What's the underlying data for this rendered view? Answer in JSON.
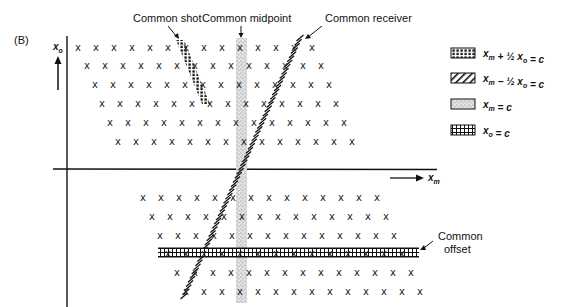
{
  "panel_label": "(B)",
  "labels": {
    "common_shot": "Common shot",
    "common_midpoint": "Common midpoint",
    "common_receiver": "Common receiver",
    "common_offset_line1": "Common",
    "common_offset_line2": "offset"
  },
  "axes": {
    "x_label_main": "x",
    "x_label_sub": "m",
    "y_label_main": "x",
    "y_label_sub": "o"
  },
  "legend": [
    {
      "pattern": "dots-dense",
      "text_a": "x",
      "sub_a": "m",
      "op": " + ½ ",
      "text_b": "x",
      "sub_b": "o",
      "rhs": " = c"
    },
    {
      "pattern": "diagonal-hatch",
      "text_a": "x",
      "sub_a": "m",
      "op": " − ½ ",
      "text_b": "x",
      "sub_b": "o",
      "rhs": " = c"
    },
    {
      "pattern": "stipple",
      "text_a": "x",
      "sub_a": "m",
      "op": "",
      "text_b": "",
      "sub_b": "",
      "rhs": " = c"
    },
    {
      "pattern": "grid-hatch",
      "text_a": "x",
      "sub_a": "o",
      "op": "",
      "text_b": "",
      "sub_b": "",
      "rhs": " = c"
    }
  ],
  "grid": {
    "marker": "x",
    "spacing": 18,
    "upper_rows": [
      {
        "y": 47,
        "x_start": 78,
        "count": 14
      },
      {
        "y": 65,
        "x_start": 87,
        "count": 14
      },
      {
        "y": 84,
        "x_start": 95,
        "count": 14
      },
      {
        "y": 103,
        "x_start": 102,
        "count": 14
      },
      {
        "y": 122,
        "x_start": 110,
        "count": 14
      },
      {
        "y": 141,
        "x_start": 118,
        "count": 14
      }
    ],
    "lower_rows": [
      {
        "y": 197,
        "x_start": 143,
        "count": 14
      },
      {
        "y": 216,
        "x_start": 152,
        "count": 14
      },
      {
        "y": 235,
        "x_start": 160,
        "count": 14
      },
      {
        "y": 253,
        "x_start": 168,
        "count": 14
      },
      {
        "y": 272,
        "x_start": 177,
        "count": 14
      },
      {
        "y": 291,
        "x_start": 186,
        "count": 14
      }
    ]
  },
  "colors": {
    "ink": "#111111",
    "stipple": "#9a9a9a",
    "background": "#ffffff"
  }
}
